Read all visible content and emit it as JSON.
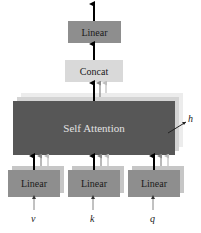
{
  "diagram": {
    "output_linear": {
      "label": "Linear",
      "color": "#8e8e8e"
    },
    "concat": {
      "label": "Concat",
      "color": "#d9d9d9"
    },
    "self_attention": {
      "label": "Self Attention",
      "color": "#575757",
      "text_color": "#e0e0e0",
      "layer_colors": [
        "#cfcfcf",
        "#e6e6e6"
      ]
    },
    "heads_label": "h",
    "input_linears": [
      {
        "label": "Linear",
        "input": "v"
      },
      {
        "label": "Linear",
        "input": "k"
      },
      {
        "label": "Linear",
        "input": "q"
      }
    ],
    "linear_color": "#8e8e8e",
    "linear_shadow_color": "#c4c4c4",
    "arrow_color": "#000000",
    "faint_arrow_colors": [
      "#8a8a8a",
      "#bdbdbd"
    ]
  }
}
